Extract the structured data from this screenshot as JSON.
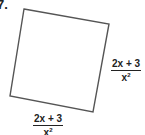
{
  "problem": {
    "number": "7."
  },
  "figure": {
    "shape": "square (rotated)",
    "stroke_color": "#555555",
    "vertices": [
      [
        24,
        9
      ],
      [
        109,
        24
      ],
      [
        93,
        112
      ],
      [
        10,
        96
      ]
    ]
  },
  "labels": {
    "right_side": {
      "numerator": "2x + 3",
      "denominator_base": "x",
      "denominator_exp": "2"
    },
    "bottom_side": {
      "numerator": "2x + 3",
      "denominator_base": "x",
      "denominator_exp": "2"
    }
  }
}
